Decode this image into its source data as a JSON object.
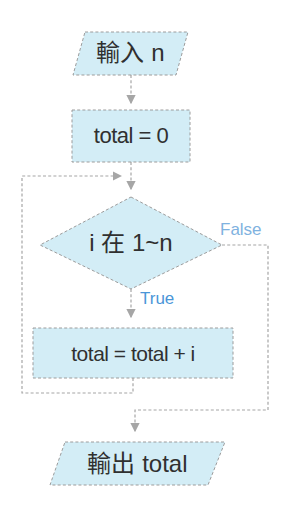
{
  "flowchart": {
    "type": "flowchart",
    "nodes": {
      "input": {
        "shape": "parallelogram",
        "label": "輸入 n"
      },
      "init": {
        "shape": "rectangle",
        "label": "total = 0"
      },
      "condition": {
        "shape": "diamond",
        "label": "i 在 1~n"
      },
      "accumulate": {
        "shape": "rectangle",
        "label": "total = total + i"
      },
      "output": {
        "shape": "parallelogram",
        "label": "輸出 total"
      }
    },
    "branch_labels": {
      "true": "True",
      "false": "False"
    },
    "colors": {
      "node_fill": "#d3edf6",
      "node_border": "#9c9c9c",
      "connector": "#a6a6a6",
      "text": "#303030",
      "true_label": "#4a96d8",
      "false_label": "#7fb2e0",
      "background": "#ffffff"
    }
  }
}
